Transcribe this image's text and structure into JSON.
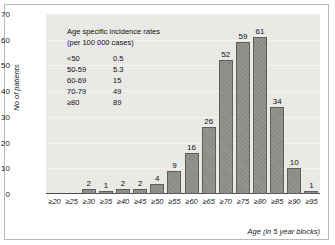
{
  "chart_data": {
    "type": "bar",
    "title": "",
    "xlabel": "Age (in 5 year blocks)",
    "ylabel": "No of patients",
    "ylim": [
      0,
      70
    ],
    "yticks": [
      0,
      10,
      20,
      30,
      40,
      50,
      60,
      70
    ],
    "grid": true,
    "legend_position": "inside-top-left",
    "categories": [
      "≥20",
      "≥25",
      "≥30",
      "≥35",
      "≥40",
      "≥45",
      "≥50",
      "≥55",
      "≥60",
      "≥65",
      "≥70",
      "≥75",
      "≥80",
      "≥85",
      "≥90",
      "≥95"
    ],
    "values": [
      0,
      0,
      2,
      1,
      2,
      2,
      4,
      9,
      16,
      26,
      52,
      59,
      61,
      34,
      10,
      1
    ],
    "value_labels": [
      "",
      "",
      "2",
      "1",
      "2",
      "2",
      "4",
      "9",
      "16",
      "26",
      "52",
      "59",
      "61",
      "34",
      "10",
      "1"
    ],
    "bar_color": "#8b8b88",
    "bar_edge_color": "#5e5e5c",
    "plot_background": "#e9e9e6",
    "annotation": {
      "title_line1": "Age specific incidence rates",
      "title_line2": "(per 100 000 cases)",
      "rows": [
        {
          "group": "<50",
          "rate": "0.5"
        },
        {
          "group": "50-59",
          "rate": "5.3"
        },
        {
          "group": "60-69",
          "rate": "15"
        },
        {
          "group": "70-79",
          "rate": "49"
        },
        {
          "group": "≥80",
          "rate": "89"
        }
      ]
    }
  }
}
